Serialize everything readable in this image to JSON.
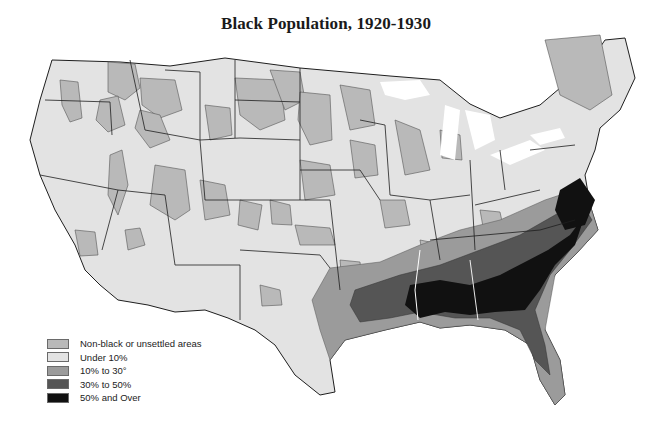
{
  "title": "Black Population, 1920-1930",
  "colors": {
    "background": "#ffffff",
    "state_border": "#1e1e1e",
    "non_black": "#b9b9b9",
    "under_10": "#e3e3e3",
    "ten_to_thirty": "#9b9b9b",
    "thirty_to_fifty": "#555555",
    "fifty_plus": "#111111"
  },
  "legend": {
    "items": [
      {
        "label": "Non-black or unsettled areas",
        "color": "#b9b9b9"
      },
      {
        "label": "Under 10%",
        "color": "#e3e3e3"
      },
      {
        "label": "10% to 30°",
        "color": "#9b9b9b"
      },
      {
        "label": "30% to 50%",
        "color": "#555555"
      },
      {
        "label": "50% and Over",
        "color": "#111111"
      }
    ]
  }
}
